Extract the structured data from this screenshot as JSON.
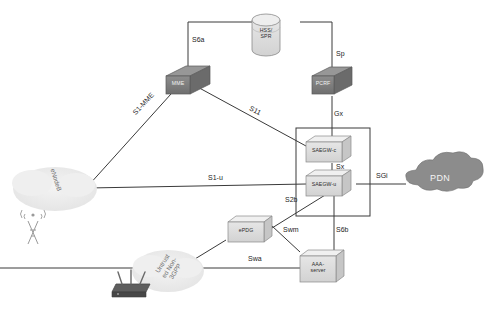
{
  "diagram": {
    "background": "#ffffff"
  },
  "colors": {
    "node_fill_dark": "#7d7d7d",
    "node_fill_light": "#dcdcdc",
    "node_stroke": "#4a4a4a",
    "cloud_light": "#ececec",
    "cloud_dark": "#8c8c8c",
    "line": "#3a3a3a",
    "label_text": "#1d1d1d",
    "cloud_text": "#6e6e6e"
  },
  "nodes": [
    {
      "id": "hss_spr",
      "name": "hss-spr-database",
      "label": "HSS/\nSPR",
      "shape": "cylinder",
      "style": "light"
    },
    {
      "id": "mme",
      "name": "mme-node",
      "label": "MME",
      "shape": "cube",
      "style": "dark"
    },
    {
      "id": "pcrf",
      "name": "pcrf-node",
      "label": "PCRF",
      "shape": "cube",
      "style": "dark"
    },
    {
      "id": "saegw_c",
      "name": "saegw-control-node",
      "label": "SAEGW-c",
      "shape": "cube",
      "style": "light"
    },
    {
      "id": "saegw_u",
      "name": "saegw-user-node",
      "label": "SAEGW-u",
      "shape": "cube",
      "style": "light"
    },
    {
      "id": "epdg",
      "name": "epdg-node",
      "label": "ePDG",
      "shape": "cube",
      "style": "light"
    },
    {
      "id": "aaa",
      "name": "aaa-server-node",
      "label": "AAA-\nserver",
      "shape": "cube",
      "style": "light"
    }
  ],
  "clouds": [
    {
      "id": "enodeb",
      "name": "enodeb-access-cloud",
      "label": "eNodeB",
      "style": "light",
      "rotated": true
    },
    {
      "id": "untrusted",
      "name": "untrusted-non3gpp-cloud",
      "label": "Untrust\ned Non-\n3GPP",
      "style": "light",
      "rotated": true
    },
    {
      "id": "pdn",
      "name": "pdn-cloud",
      "label": "PDN",
      "style": "dark",
      "rotated": false
    }
  ],
  "access_devices": [
    {
      "id": "cell_tower",
      "name": "cell-tower-icon",
      "label": ""
    },
    {
      "id": "wifi_router",
      "name": "wifi-router-icon",
      "label": ""
    }
  ],
  "interfaces": [
    {
      "id": "s6a",
      "name": "interface-label-s6a",
      "label": "S6a",
      "from": "mme",
      "to": "hss_spr"
    },
    {
      "id": "sp",
      "name": "interface-label-sp",
      "label": "Sp",
      "from": "pcrf",
      "to": "hss_spr"
    },
    {
      "id": "gx",
      "name": "interface-label-gx",
      "label": "Gx",
      "from": "pcrf",
      "to": "saegw_c"
    },
    {
      "id": "s1mme",
      "name": "interface-label-s1-mme",
      "label": "S1-MME",
      "from": "enodeb",
      "to": "mme"
    },
    {
      "id": "s11",
      "name": "interface-label-s11",
      "label": "S11",
      "from": "mme",
      "to": "saegw_c"
    },
    {
      "id": "s1u",
      "name": "interface-label-s1-u",
      "label": "S1-u",
      "from": "enodeb",
      "to": "saegw_u"
    },
    {
      "id": "sx",
      "name": "interface-label-sx",
      "label": "Sx",
      "from": "saegw_c",
      "to": "saegw_u"
    },
    {
      "id": "sgi",
      "name": "interface-label-sgi",
      "label": "SGi",
      "from": "saegw_u",
      "to": "pdn"
    },
    {
      "id": "s2b",
      "name": "interface-label-s2b",
      "label": "S2b",
      "from": "epdg",
      "to": "saegw_u"
    },
    {
      "id": "swm",
      "name": "interface-label-swm",
      "label": "Swm",
      "from": "epdg",
      "to": "aaa"
    },
    {
      "id": "s6b",
      "name": "interface-label-s6b",
      "label": "S6b",
      "from": "saegw_u",
      "to": "aaa"
    },
    {
      "id": "swa",
      "name": "interface-label-swa",
      "label": "Swa",
      "from": "untrusted",
      "to": "aaa"
    }
  ]
}
